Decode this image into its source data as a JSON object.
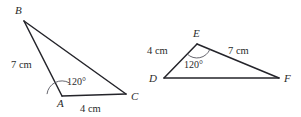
{
  "figure": {
    "background_color": "#ffffff",
    "stroke_color": "#24242a",
    "text_color": "#2b2b2b",
    "arc_color": "#55555d",
    "triangles": [
      {
        "id": "triangle-abc",
        "name": "triangle-abc",
        "vertices": [
          {
            "name": "A",
            "label": "A",
            "x": 62,
            "y": 96,
            "label_x": 57,
            "label_y": 106
          },
          {
            "name": "B",
            "label": "B",
            "x": 24,
            "y": 21,
            "label_x": 15,
            "label_y": 14
          },
          {
            "name": "C",
            "label": "C",
            "x": 126,
            "y": 94,
            "label_x": 131,
            "label_y": 100
          }
        ],
        "sides": [
          {
            "name": "side-ab",
            "from": "A",
            "to": "B",
            "label": "7 cm",
            "label_x": 12,
            "label_y": 68
          },
          {
            "name": "side-ac",
            "from": "A",
            "to": "C",
            "label": "4 cm",
            "label_x": 80,
            "label_y": 112
          },
          {
            "name": "side-bc",
            "from": "B",
            "to": "C",
            "label": "",
            "label_x": 0,
            "label_y": 0
          }
        ],
        "angle": {
          "name": "angle-a",
          "at": "A",
          "label": "120°",
          "label_x": 67,
          "label_y": 85,
          "arc_radius": 15
        }
      },
      {
        "id": "triangle-def",
        "name": "triangle-def",
        "vertices": [
          {
            "name": "D",
            "label": "D",
            "x": 164,
            "y": 78,
            "label_x": 150,
            "label_y": 82
          },
          {
            "name": "E",
            "label": "E",
            "x": 197,
            "y": 44,
            "label_x": 193,
            "label_y": 36
          },
          {
            "name": "F",
            "label": "F",
            "x": 279,
            "y": 78,
            "label_x": 284,
            "label_y": 82
          }
        ],
        "sides": [
          {
            "name": "side-de",
            "from": "D",
            "to": "E",
            "label": "4 cm",
            "label_x": 148,
            "label_y": 54
          },
          {
            "name": "side-ef",
            "from": "E",
            "to": "F",
            "label": "7 cm",
            "label_x": 228,
            "label_y": 54
          },
          {
            "name": "side-df",
            "from": "D",
            "to": "F",
            "label": "",
            "label_x": 0,
            "label_y": 0
          }
        ],
        "angle": {
          "name": "angle-e",
          "at": "E",
          "label": "120°",
          "label_x": 184,
          "label_y": 68,
          "arc_radius": 14
        }
      }
    ]
  },
  "labels": {
    "abc": {
      "vertex_a": "A",
      "vertex_b": "B",
      "vertex_c": "C",
      "side_ab": "7 cm",
      "side_ac": "4 cm",
      "angle_a": "120°"
    },
    "def": {
      "vertex_d": "D",
      "vertex_e": "E",
      "vertex_f": "F",
      "side_de": "4 cm",
      "side_ef": "7 cm",
      "angle_e": "120°"
    }
  }
}
